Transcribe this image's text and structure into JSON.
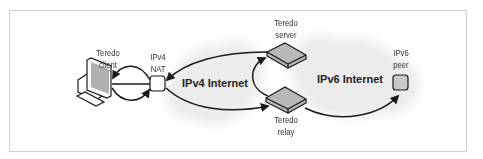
{
  "diagram": {
    "nodes": {
      "client": {
        "label_line1": "Teredo",
        "label_line2": "client"
      },
      "nat": {
        "label_line1": "IPv4",
        "label_line2": "NAT"
      },
      "server": {
        "label_line1": "Teredo",
        "label_line2": "server"
      },
      "relay": {
        "label_line1": "Teredo",
        "label_line2": "relay"
      },
      "peer": {
        "label_line1": "IPv6",
        "label_line2": "peer"
      }
    },
    "networks": {
      "ipv4": "IPv4 Internet",
      "ipv6": "IPv6 Internet"
    },
    "colors": {
      "cloud": "#ececec",
      "device_fill": "#b8b8b8",
      "stroke": "#1a1a1a",
      "frame": "#cfcfcf"
    }
  }
}
